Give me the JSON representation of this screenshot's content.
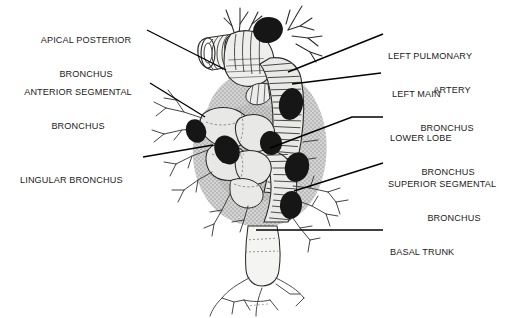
{
  "figure": {
    "style": "black-and-white line drawing with stippled gray lung shadow",
    "colors": {
      "background": "#ffffff",
      "ink": "#1a1a1a",
      "leader_line": "#000000",
      "lymph_node_fill": "#161616",
      "lung_shadow": "#c9c9c9",
      "lung_shadow_dark": "#bdbdbd",
      "structure_fill": "#e8e8e6",
      "hatch": "#2a2a2a"
    }
  },
  "labels": {
    "apical_posterior": {
      "line1": "APICAL POSTERIOR",
      "line2": "BRONCHUS",
      "side": "left"
    },
    "anterior_segmental": {
      "line1": "ANTERIOR SEGMENTAL",
      "line2": "BRONCHUS",
      "side": "left"
    },
    "lingular": {
      "line1": "LINGULAR BRONCHUS",
      "line2": "",
      "side": "left"
    },
    "left_pulmonary_artery": {
      "line1": "LEFT PULMONARY",
      "line2": "ARTERY",
      "side": "right"
    },
    "left_main_bronchus": {
      "line1": "LEFT MAIN",
      "line2": "BRONCHUS",
      "side": "right"
    },
    "lower_lobe_bronchus": {
      "line1": "LOWER LOBE",
      "line2": "BRONCHUS",
      "side": "right"
    },
    "superior_segmental": {
      "line1": "SUPERIOR SEGMENTAL",
      "line2": "BRONCHUS",
      "side": "right"
    },
    "basal_trunk": {
      "line1": "BASAL TRUNK",
      "line2": "",
      "side": "right"
    }
  },
  "leader_lines": {
    "apical_posterior": "M147,30 L226,70",
    "anterior_segmental": "M150,83 L205,117",
    "lingular": "M143,157 L213,145",
    "left_pulmonary_artery": "M383,34 L288,72",
    "left_main_bronchus": "M381,73 L292,84",
    "lower_lobe_bronchus": "M383,117 L352,117 L270,148",
    "superior_segmental": "M383,163 L294,191",
    "basal_trunk": "M383,230 L256,230"
  },
  "lymph_nodes": [
    {
      "cx": 268,
      "cy": 30,
      "rx": 15,
      "ry": 13,
      "rot": -12
    },
    {
      "cx": 196,
      "cy": 131,
      "rx": 10,
      "ry": 12,
      "rot": -22
    },
    {
      "cx": 227,
      "cy": 150,
      "rx": 12,
      "ry": 15,
      "rot": -28
    },
    {
      "cx": 291,
      "cy": 104,
      "rx": 12,
      "ry": 16,
      "rot": 10
    },
    {
      "cx": 271,
      "cy": 143,
      "rx": 11,
      "ry": 12,
      "rot": -8
    },
    {
      "cx": 297,
      "cy": 167,
      "rx": 12,
      "ry": 15,
      "rot": 14
    },
    {
      "cx": 291,
      "cy": 205,
      "rx": 11,
      "ry": 14,
      "rot": 6
    }
  ]
}
